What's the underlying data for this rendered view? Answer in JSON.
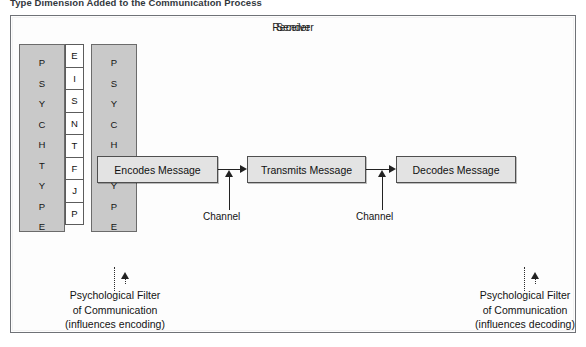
{
  "figure": {
    "caption": "Type Dimension Added to the Communication Process"
  },
  "sender": {
    "title": "Sender",
    "psych_lines": [
      "P",
      "S",
      "Y",
      "C",
      "H"
    ],
    "type_lines": [
      "T",
      "Y",
      "P",
      "E"
    ],
    "letters_top": [
      "E",
      "I",
      "S",
      "N"
    ],
    "letters_bottom": [
      "T",
      "F",
      "J",
      "P"
    ],
    "filter_caption": {
      "line1": "Psychological Filter",
      "line2": "of Communication",
      "line3": "(influences encoding)"
    }
  },
  "receiver": {
    "title": "Receiver",
    "psych_lines": [
      "P",
      "S",
      "Y",
      "C",
      "H"
    ],
    "type_lines": [
      "T",
      "Y",
      "P",
      "E"
    ],
    "letters_top": [
      "E",
      "I",
      "S",
      "N"
    ],
    "letters_bottom": [
      "T",
      "F",
      "J",
      "P"
    ],
    "filter_caption": {
      "line1": "Psychological Filter",
      "line2": "of Communication",
      "line3": "(influences decoding)"
    }
  },
  "process": {
    "encodes": "Encodes Message",
    "transmits": "Transmits Message",
    "decodes": "Decodes Message"
  },
  "channels": {
    "left_label": "Channel",
    "right_label": "Channel"
  },
  "colors": {
    "frame_border": "#6f7277",
    "party_fill": "#f0f0f0",
    "psych_panel_fill": "#c9c9c9",
    "process_fill": "#e3e3e3",
    "line": "#222222"
  }
}
